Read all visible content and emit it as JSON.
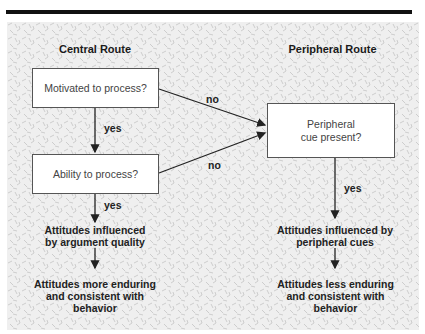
{
  "figure": {
    "central_route": {
      "title": "Central Route",
      "box_motivated": "Motivated to process?",
      "box_ability": "Ability to process?",
      "yes_1": "yes",
      "yes_2": "yes",
      "outcome_1": "Attitudes influenced by argument quality",
      "outcome_2": "Attitudes more enduring and consistent with behavior"
    },
    "peripheral_route": {
      "title": "Peripheral Route",
      "box_cue": "Peripheral cue present?",
      "yes": "yes",
      "outcome_1": "Attitudes influenced by peripheral cues",
      "outcome_2": "Attitudes less enduring and consistent with behavior"
    },
    "connectors": {
      "no_top": "no",
      "no_bottom": "no"
    }
  }
}
